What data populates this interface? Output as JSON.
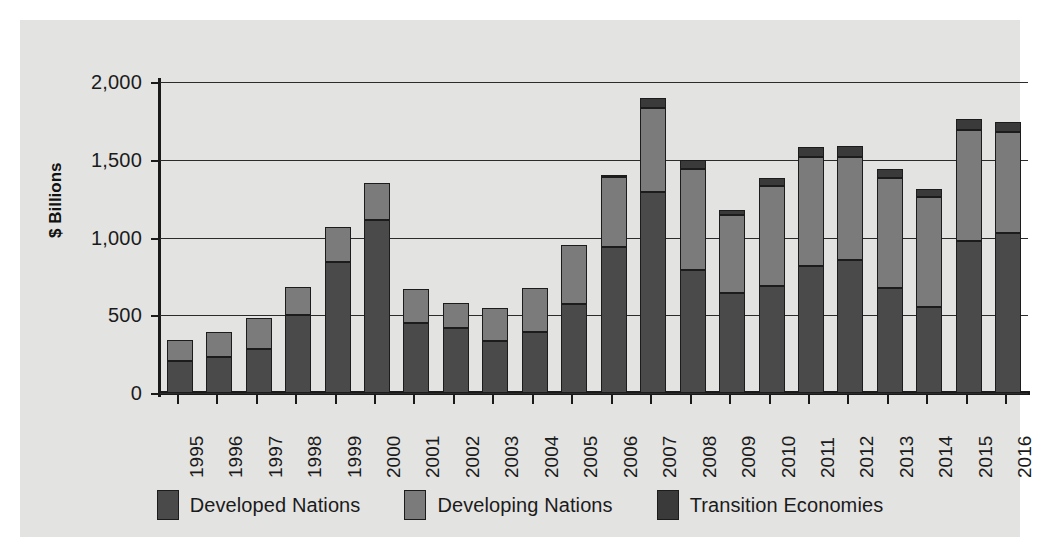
{
  "chart_data": {
    "type": "bar",
    "stacked": true,
    "title": "",
    "xlabel": "",
    "ylabel": "$ Billions",
    "ylim": [
      0,
      2000
    ],
    "ytick_labels": [
      "0",
      "500",
      "1,000",
      "1,500",
      "2,000"
    ],
    "ytick_values": [
      0,
      500,
      1000,
      1500,
      2000
    ],
    "grid": true,
    "legend_position": "bottom",
    "categories": [
      "1995",
      "1996",
      "1997",
      "1998",
      "1999",
      "2000",
      "2001",
      "2002",
      "2003",
      "2004",
      "2005",
      "2006",
      "2007",
      "2008",
      "2009",
      "2010",
      "2011",
      "2012",
      "2013",
      "2014",
      "2015",
      "2016"
    ],
    "series": [
      {
        "name": "Developed Nations",
        "color": "#4a4a4a",
        "values": [
          205,
          230,
          285,
          500,
          845,
          1110,
          450,
          415,
          335,
          390,
          575,
          940,
          1290,
          790,
          645,
          690,
          820,
          855,
          675,
          550,
          975,
          1030
        ]
      },
      {
        "name": "Developing Nations",
        "color": "#7b7b7b",
        "values": [
          135,
          160,
          195,
          180,
          225,
          240,
          220,
          165,
          210,
          285,
          375,
          450,
          545,
          650,
          500,
          640,
          700,
          665,
          710,
          710,
          715,
          650
        ]
      },
      {
        "name": "Transition Economies",
        "color": "#3a3a3a",
        "values": [
          0,
          0,
          0,
          0,
          0,
          0,
          0,
          0,
          0,
          0,
          0,
          10,
          60,
          60,
          35,
          55,
          65,
          70,
          55,
          50,
          70,
          60
        ]
      }
    ]
  },
  "legend": {
    "items": [
      {
        "label": "Developed Nations",
        "color": "#4a4a4a"
      },
      {
        "label": "Developing Nations",
        "color": "#7b7b7b"
      },
      {
        "label": "Transition Economies",
        "color": "#3a3a3a"
      }
    ]
  }
}
